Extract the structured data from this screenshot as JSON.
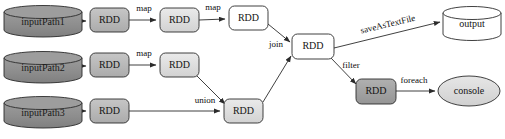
{
  "diagram": {
    "canvas": {
      "width": 505,
      "height": 139,
      "background": "#ffffff"
    },
    "palette": {
      "cylinder_dark_fill": "#8f8f8f",
      "cylinder_dark_top": "#9d9d9d",
      "cylinder_white_fill": "#ffffff",
      "rdd_mid_gray_fill": "#b9b9b9",
      "rdd_light_gray_fill": "#dedede",
      "rdd_white_fill": "#ffffff",
      "rdd_dark_gray_fill": "#a3a3a3",
      "ellipse_fill": "#dcdcdc",
      "stroke": "#2b2b2b",
      "text": "#141414"
    },
    "nodes": [
      {
        "id": "inputPath1",
        "label": "inputPath1",
        "shape": "cylinder",
        "fill": "#8f8f8f",
        "x": 4,
        "y": 6,
        "w": 78,
        "h": 30
      },
      {
        "id": "inputPath2",
        "label": "inputPath2",
        "shape": "cylinder",
        "fill": "#8f8f8f",
        "x": 4,
        "y": 52,
        "w": 78,
        "h": 30
      },
      {
        "id": "inputPath3",
        "label": "inputPath3",
        "shape": "cylinder",
        "fill": "#8f8f8f",
        "x": 4,
        "y": 97,
        "w": 78,
        "h": 30
      },
      {
        "id": "rdd_a1",
        "label": "RDD",
        "shape": "roundrect",
        "fill": "#b9b9b9",
        "x": 90,
        "y": 8,
        "w": 39,
        "h": 24
      },
      {
        "id": "rdd_a2",
        "label": "RDD",
        "shape": "roundrect",
        "fill": "#dedede",
        "x": 160,
        "y": 8,
        "w": 39,
        "h": 24
      },
      {
        "id": "rdd_a3",
        "label": "RDD",
        "shape": "roundrect",
        "fill": "#ffffff",
        "x": 229,
        "y": 6,
        "w": 39,
        "h": 24
      },
      {
        "id": "rdd_b1",
        "label": "RDD",
        "shape": "roundrect",
        "fill": "#b9b9b9",
        "x": 90,
        "y": 53,
        "w": 39,
        "h": 24
      },
      {
        "id": "rdd_b2",
        "label": "RDD",
        "shape": "roundrect",
        "fill": "#dedede",
        "x": 160,
        "y": 53,
        "w": 39,
        "h": 24
      },
      {
        "id": "rdd_c1",
        "label": "RDD",
        "shape": "roundrect",
        "fill": "#b9b9b9",
        "x": 90,
        "y": 99,
        "w": 39,
        "h": 24
      },
      {
        "id": "rdd_union",
        "label": "RDD",
        "shape": "roundrect",
        "fill": "#dedede",
        "x": 224,
        "y": 99,
        "w": 39,
        "h": 24
      },
      {
        "id": "rdd_join",
        "label": "RDD",
        "shape": "roundrect",
        "fill": "#ffffff",
        "x": 292,
        "y": 34,
        "w": 42,
        "h": 25
      },
      {
        "id": "rdd_filter",
        "label": "RDD",
        "shape": "roundrect",
        "fill": "#a3a3a3",
        "x": 356,
        "y": 79,
        "w": 40,
        "h": 25
      },
      {
        "id": "output",
        "label": "output",
        "shape": "cylinder",
        "fill": "#ffffff",
        "x": 443,
        "y": 6,
        "w": 58,
        "h": 34
      },
      {
        "id": "console",
        "label": "console",
        "shape": "ellipse",
        "fill": "#dcdcdc",
        "x": 438,
        "y": 76,
        "w": 62,
        "h": 30
      }
    ],
    "edges": [
      {
        "id": "e1",
        "from": "inputPath1",
        "to": "rdd_a1",
        "label": ""
      },
      {
        "id": "e2",
        "from": "rdd_a1",
        "to": "rdd_a2",
        "label": "map"
      },
      {
        "id": "e3",
        "from": "rdd_a2",
        "to": "rdd_a3",
        "label": "map"
      },
      {
        "id": "e4",
        "from": "inputPath2",
        "to": "rdd_b1",
        "label": ""
      },
      {
        "id": "e5",
        "from": "rdd_b1",
        "to": "rdd_b2",
        "label": "map"
      },
      {
        "id": "e6",
        "from": "rdd_b2",
        "to": "rdd_union",
        "label": ""
      },
      {
        "id": "e7",
        "from": "inputPath3",
        "to": "rdd_c1",
        "label": ""
      },
      {
        "id": "e8",
        "from": "rdd_c1",
        "to": "rdd_union",
        "label": "union"
      },
      {
        "id": "e9",
        "from": "rdd_a3",
        "to": "rdd_join",
        "label": "join"
      },
      {
        "id": "e10",
        "from": "rdd_union",
        "to": "rdd_join",
        "label": ""
      },
      {
        "id": "e11",
        "from": "rdd_join",
        "to": "output",
        "label": "saveAsTextFile"
      },
      {
        "id": "e12",
        "from": "rdd_join",
        "to": "rdd_filter",
        "label": "filter"
      },
      {
        "id": "e13",
        "from": "rdd_filter",
        "to": "console",
        "label": "foreach"
      }
    ],
    "edge_labels": {
      "map_1": "map",
      "map_2": "map",
      "map_3": "map",
      "union": "union",
      "join": "join",
      "saveAsTextFile": "saveAsTextFile",
      "filter": "filter",
      "foreach": "foreach"
    }
  }
}
